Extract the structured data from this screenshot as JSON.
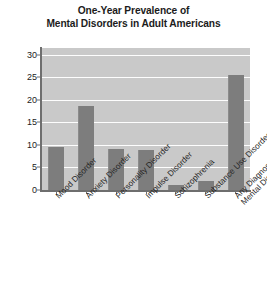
{
  "chart_data": {
    "type": "bar",
    "title": "One-Year Prevalence of Mental Disorders in Adult Americans",
    "title_lines": [
      "One-Year Prevalence of",
      "Mental Disorders in Adult Americans"
    ],
    "xlabel": "",
    "ylabel": "",
    "ylim": [
      0,
      31.5
    ],
    "yticks": [
      0,
      5,
      10,
      15,
      20,
      25,
      30
    ],
    "ytick_labels": [
      "0",
      "5",
      "10",
      "15",
      "20",
      "25",
      "30"
    ],
    "grid": true,
    "grid_axis": "y",
    "grid_color": "#fdfdfd",
    "legend": false,
    "categories": [
      "Mood Disorder",
      "Anxiety Disorder",
      "Personality Disorder",
      "Impulse Disorder",
      "Schizophrenia",
      "Substance Use Disorder",
      "Any Diagnosable Mental Disorder"
    ],
    "category_lines": [
      [
        "Mood Disorder"
      ],
      [
        "Anxiety Disorder"
      ],
      [
        "Personality Disorder"
      ],
      [
        "Impulse Disorder"
      ],
      [
        "Schizophrenia"
      ],
      [
        "Substance Use Disorder"
      ],
      [
        "Any Diagnosable",
        "Mental Disorder"
      ]
    ],
    "values": [
      9.5,
      18.7,
      9.1,
      8.9,
      1.1,
      1.9,
      25.6
    ],
    "bar_color": "#7d7d7d",
    "plot_background": "#c9c9c9",
    "figure_background": "#ffffff",
    "axis_color": "#6e6e6e"
  }
}
